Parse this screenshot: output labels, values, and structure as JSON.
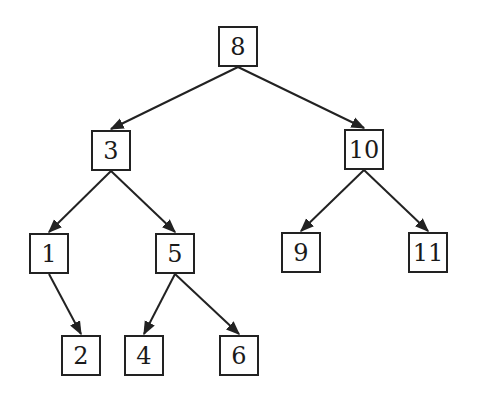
{
  "diagram": {
    "type": "binary-search-tree",
    "colors": {
      "stroke": "#222222",
      "background": "#ffffff",
      "text": "#1a1a1a"
    },
    "nodes": [
      {
        "id": "n8",
        "label": "8",
        "x": 218,
        "y": 26
      },
      {
        "id": "n3",
        "label": "3",
        "x": 91,
        "y": 130
      },
      {
        "id": "n10",
        "label": "10",
        "x": 344,
        "y": 129
      },
      {
        "id": "n1",
        "label": "1",
        "x": 29,
        "y": 233
      },
      {
        "id": "n5",
        "label": "5",
        "x": 155,
        "y": 233
      },
      {
        "id": "n9",
        "label": "9",
        "x": 281,
        "y": 232
      },
      {
        "id": "n11",
        "label": "11",
        "x": 408,
        "y": 232
      },
      {
        "id": "n2",
        "label": "2",
        "x": 61,
        "y": 335
      },
      {
        "id": "n4",
        "label": "4",
        "x": 124,
        "y": 335
      },
      {
        "id": "n6",
        "label": "6",
        "x": 219,
        "y": 335
      }
    ],
    "edges": [
      {
        "from": "n8",
        "to": "n3"
      },
      {
        "from": "n8",
        "to": "n10"
      },
      {
        "from": "n3",
        "to": "n1"
      },
      {
        "from": "n3",
        "to": "n5"
      },
      {
        "from": "n10",
        "to": "n9"
      },
      {
        "from": "n10",
        "to": "n11"
      },
      {
        "from": "n1",
        "to": "n2"
      },
      {
        "from": "n5",
        "to": "n4"
      },
      {
        "from": "n5",
        "to": "n6"
      }
    ]
  }
}
